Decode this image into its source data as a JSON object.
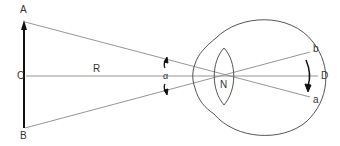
{
  "diagram": {
    "type": "optics-eye-visual-angle",
    "labels": {
      "A": "A",
      "B": "B",
      "C": "C",
      "R": "R",
      "alpha": "α",
      "N": "N",
      "b": "b",
      "D": "D",
      "a": "a"
    },
    "colors": {
      "line": "#8a8a8a",
      "outline": "#555555",
      "arrow": "#111111",
      "text": "#333333"
    }
  }
}
